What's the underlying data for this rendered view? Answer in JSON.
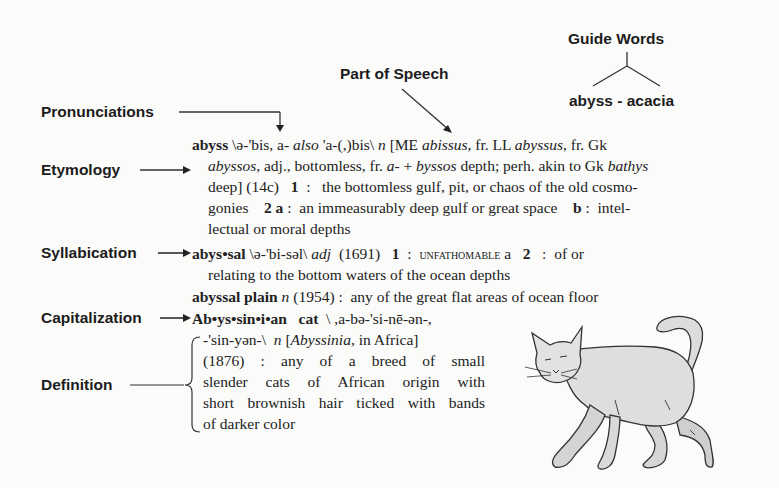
{
  "labels": {
    "guide_words": "Guide Words",
    "guide_words_value": "abyss - acacia",
    "part_of_speech": "Part of Speech",
    "pronunciations": "Pronunciations",
    "etymology": "Etymology",
    "syllabication": "Syllabication",
    "capitalization": "Capitalization",
    "definition": "Definition"
  },
  "entries": {
    "abyss": {
      "headword": "abyss",
      "pron1": " \\ə-'bis, a- ",
      "also": "also",
      "pron2": " 'a-(,)bis\\ ",
      "pos": "n",
      "ety1": " [ME ",
      "ety_abissus": "abissus",
      "ety2": ", fr. LL ",
      "ety_abyssus": "abyssus",
      "ety3": ", fr. Gk",
      "line2_abyssos": "abyssos",
      "line2a": ", adj., bottomless, fr. ",
      "line2_a": "a-",
      "line2b": " + ",
      "line2_byssos": "byssos",
      "line2c": " depth; perh. akin to Gk ",
      "line2_bathys": "bathys",
      "line3a": "deep] (14c)   ",
      "sense1": "1",
      "line3b": "  :   the bottomless gulf, pit, or chaos of the old cosmo-",
      "line4a": "gonies    ",
      "sense2": "2",
      "sense2a": "a",
      "line4b": " :  an immeasurably deep gulf or great space    ",
      "sense2b": "b",
      "line4c": " :  intel-",
      "line5": "lectual or moral depths"
    },
    "abyssal": {
      "headword": "abys•sal",
      "pron": " \\ə-'bi-səl\\ ",
      "pos": "adj",
      "date": "  (1691)   ",
      "sense1": "1",
      "colon1": "  :  ",
      "xref": "unfathomable",
      "xref_a": " a   ",
      "sense2": "2",
      "rest": "   :  of or",
      "line2": "relating to the bottom waters of the ocean depths"
    },
    "abyssal_plain": {
      "headword": "abyssal plain",
      "pos": "n",
      "rest": " (1954) :  any of the great flat areas of ocean floor"
    },
    "abyssinian_cat": {
      "headword": "Ab•ys•sin•i•an   cat",
      "pron1": "  \\ ,a-bə-'si-nē-ən-,",
      "line2a": "-'sin-yən-\\  ",
      "pos": "n",
      "line2b": " [",
      "ety_word": "Abyssinia",
      "line2c": ", in Africa]",
      "line3": "(1876)   :  any of a breed of small",
      "line4": "slender cats of African origin with",
      "line5": "short brownish hair ticked with bands",
      "line6": "of darker color"
    }
  },
  "illustration": {
    "subject": "cat-illustration"
  }
}
